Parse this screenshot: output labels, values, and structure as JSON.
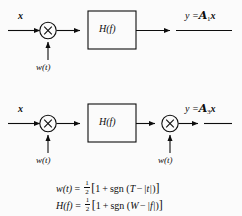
{
  "figure": {
    "background_color": "#fbfbfb",
    "ink_color": "#0d0d0d",
    "diagrams": [
      {
        "id": "diagram-1",
        "input_label": "x",
        "multiplier_glyph": "×",
        "multiplier_count": 1,
        "filter_label": "H(f)",
        "noise_labels": [
          "w(t)"
        ],
        "output_label_prefix": "y =",
        "output_operator": "ℋ",
        "output_operator_letter": "A",
        "output_operator_subscript": "1",
        "output_operand": "x",
        "output_label_full": "y = A₁x"
      },
      {
        "id": "diagram-2",
        "input_label": "x",
        "multiplier_glyph": "×",
        "multiplier_count": 2,
        "filter_label": "H(f)",
        "noise_labels": [
          "w(t)",
          "w(t)"
        ],
        "output_label_prefix": "y =",
        "output_operator": "ℋ",
        "output_operator_letter": "A",
        "output_operator_subscript": "3",
        "output_operand": "x",
        "output_label_full": "y = A₃x"
      }
    ],
    "equations": [
      {
        "id": "equation-wt",
        "lhs": "w(t)",
        "equals": "=",
        "fraction_numerator": "1",
        "fraction_denominator": "2",
        "open_bracket": "[",
        "body_one": "1",
        "body_plus": "+",
        "body_fn": "sgn",
        "body_open_paren": "(",
        "body_arg_first": "T",
        "body_arg_minus": "−",
        "body_arg_second": "|t|",
        "body_close_paren": ")",
        "close_bracket": "]",
        "full_text": "w(t) = ½[1 + sgn (T − |t|)]"
      },
      {
        "id": "equation-hf",
        "lhs": "H(f)",
        "equals": "=",
        "fraction_numerator": "1",
        "fraction_denominator": "2",
        "open_bracket": "[",
        "body_one": "1",
        "body_plus": "+",
        "body_fn": "sgn",
        "body_open_paren": "(",
        "body_arg_first": "W",
        "body_arg_minus": "−",
        "body_arg_second": "|f|",
        "body_close_paren": ")",
        "close_bracket": "]",
        "full_text": "H(f) = ½[1 + sgn (W − |f|)]"
      }
    ]
  }
}
